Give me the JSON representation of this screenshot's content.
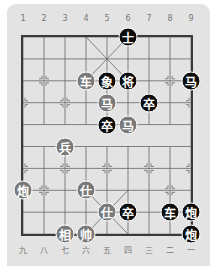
{
  "board": {
    "top_labels": [
      "1",
      "2",
      "3",
      "4",
      "5",
      "6",
      "7",
      "8",
      "9"
    ],
    "bottom_labels": [
      "九",
      "八",
      "七",
      "六",
      "五",
      "四",
      "三",
      "二",
      "一"
    ],
    "colors": {
      "panel": "#e3e3e3",
      "red_piece": "#7a7a7a",
      "black_piece": "#0d0d0d",
      "grid": "#555555"
    }
  },
  "pieces": [
    {
      "char": "士",
      "side": "black",
      "col": 6,
      "row": 0
    },
    {
      "char": "车",
      "side": "red",
      "col": 4,
      "row": 2
    },
    {
      "char": "象",
      "side": "black",
      "col": 5,
      "row": 2
    },
    {
      "char": "将",
      "side": "black",
      "col": 6,
      "row": 2
    },
    {
      "char": "马",
      "side": "black",
      "col": 9,
      "row": 2
    },
    {
      "char": "马",
      "side": "red",
      "col": 5,
      "row": 3
    },
    {
      "char": "卒",
      "side": "black",
      "col": 7,
      "row": 3
    },
    {
      "char": "卒",
      "side": "black",
      "col": 5,
      "row": 4
    },
    {
      "char": "马",
      "side": "red",
      "col": 6,
      "row": 4
    },
    {
      "char": "兵",
      "side": "red",
      "col": 3,
      "row": 5
    },
    {
      "char": "炮",
      "side": "red",
      "col": 1,
      "row": 7
    },
    {
      "char": "仕",
      "side": "red",
      "col": 4,
      "row": 7
    },
    {
      "char": "仕",
      "side": "red",
      "col": 5,
      "row": 8
    },
    {
      "char": "卒",
      "side": "black",
      "col": 6,
      "row": 8
    },
    {
      "char": "车",
      "side": "black",
      "col": 8,
      "row": 8
    },
    {
      "char": "炮",
      "side": "black",
      "col": 9,
      "row": 8
    },
    {
      "char": "相",
      "side": "red",
      "col": 3,
      "row": 9
    },
    {
      "char": "帅",
      "side": "red",
      "col": 4,
      "row": 9
    },
    {
      "char": "炮",
      "side": "black",
      "col": 9,
      "row": 9
    }
  ]
}
